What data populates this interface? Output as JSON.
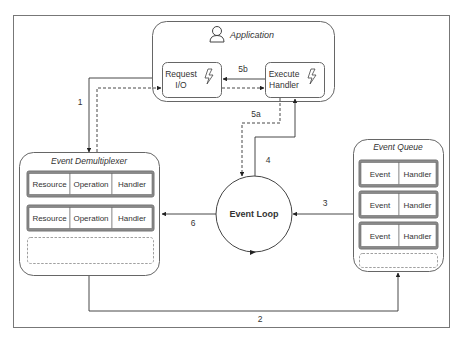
{
  "diagram": {
    "application": {
      "title": "Application",
      "icon": "user-icon"
    },
    "request_io": {
      "line1": "Request",
      "line2": "I/O",
      "icon": "lightning-icon"
    },
    "execute_handler": {
      "line1": "Execute",
      "line2": "Handler",
      "icon": "lightning-icon"
    },
    "event_loop": {
      "label": "Event Loop"
    },
    "demultiplexer": {
      "title": "Event Demultiplexer",
      "rows": [
        {
          "cells": [
            "Resource",
            "Operation",
            "Handler"
          ]
        },
        {
          "cells": [
            "Resource",
            "Operation",
            "Handler"
          ]
        }
      ]
    },
    "event_queue": {
      "title": "Event Queue",
      "rows": [
        {
          "cells": [
            "Event",
            "Handler"
          ]
        },
        {
          "cells": [
            "Event",
            "Handler"
          ]
        },
        {
          "cells": [
            "Event",
            "Handler"
          ]
        }
      ]
    },
    "edges": {
      "e1": "1",
      "e2": "2",
      "e3": "3",
      "e4": "4",
      "e5a": "5a",
      "e5b": "5b",
      "e6": "6"
    },
    "colors": {
      "stroke": "#555555",
      "row_border": "#777777",
      "row_fill": "#8a8a8a",
      "text": "#333333"
    }
  }
}
